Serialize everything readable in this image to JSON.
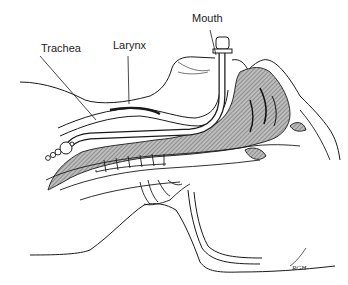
{
  "figure": {
    "type": "anatomical-line-drawing",
    "colors": {
      "line": "#1a1a1a",
      "hatch_fill": "#9a9a9a",
      "background": "#ffffff"
    }
  },
  "labels": {
    "mouth": "Mouth",
    "trachea": "Trachea",
    "larynx": "Larynx"
  },
  "signature": "RGH"
}
